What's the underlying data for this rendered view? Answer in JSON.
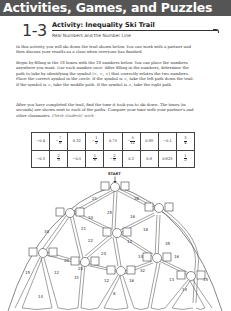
{
  "banner": {
    "title": "Activities, Games, and Puzzles"
  },
  "lesson": {
    "number": "1-3",
    "title": "Activity: Inequality Ski Trail",
    "subtitle": "Real Numbers and the Number Line"
  },
  "instructions": {
    "p1": "In this activity, you will ski down the trail shown below. You can work with a partner and then discuss your results as a class when everyone has finished.",
    "p2": "Begin by filling in the 18 boxes with the 18 numbers below. You can place the numbers anywhere you want. Use each number once. After filling in the numbers, determine the path to take by identifying the symbol (<, =, >) that correctly relates the two numbers. Place the correct symbol in the circle. If the symbol is <, take the left path down the trail. If the symbol is =, take the middle path. If the symbol is >, take the right path.",
    "p3": "After you have completed the trail, find the time it took you to ski down. The times (in seconds) are shown next to each of the paths. Compare your time with your partner's and other classmates.",
    "answer_note": "Check students' work."
  },
  "number_table": {
    "rows": [
      [
        {
          "type": "dec",
          "v": "−0.4"
        },
        {
          "type": "frac",
          "sign": "−",
          "n": "7",
          "d": "8"
        },
        {
          "type": "dec",
          "v": "0.32"
        },
        {
          "type": "frac",
          "sign": "−",
          "n": "1",
          "d": "2"
        },
        {
          "type": "dec",
          "v": "0.75"
        },
        {
          "type": "frac",
          "sign": "−",
          "n": "5",
          "d": "12"
        },
        {
          "type": "dec",
          "v": "0.89"
        },
        {
          "type": "dec",
          "v": "−0.1"
        },
        {
          "type": "frac",
          "sign": "",
          "n": "3",
          "d": "4"
        }
      ],
      [
        {
          "type": "dec",
          "v": "−0.3"
        },
        {
          "type": "frac",
          "sign": "",
          "n": "2",
          "d": "3"
        },
        {
          "type": "dec",
          "v": "−0.5"
        },
        {
          "type": "frac",
          "sign": "",
          "n": "1",
          "d": "6"
        },
        {
          "type": "frac",
          "sign": "−",
          "n": "2",
          "d": "5"
        },
        {
          "type": "dec",
          "v": "0.2"
        },
        {
          "type": "dec",
          "v": "0.6"
        },
        {
          "type": "dec",
          "v": "0.625"
        },
        {
          "type": "frac",
          "sign": "",
          "n": "1",
          "d": "2"
        }
      ]
    ]
  },
  "trail": {
    "start_label": "START",
    "times": {
      "start_left": "21",
      "start_mid": "25",
      "start_right": "38",
      "a_right": "10",
      "a_left": "34",
      "a_mid": "21",
      "b_left": "16",
      "b_mid": "18",
      "b_right": "35",
      "c_left": "22",
      "c_right": "13",
      "d_left": "20",
      "d_right": "24",
      "e_left": "14",
      "e_right": "16",
      "e_mid": "32",
      "f_left": "15",
      "f_right": "12",
      "f_bottom": "14",
      "g_mid": "31",
      "g_left": "20",
      "h_left": "12",
      "h_right": "16",
      "h_bottom": "8",
      "i_left": "13",
      "i_right": "15",
      "i_bottom": "14"
    }
  }
}
